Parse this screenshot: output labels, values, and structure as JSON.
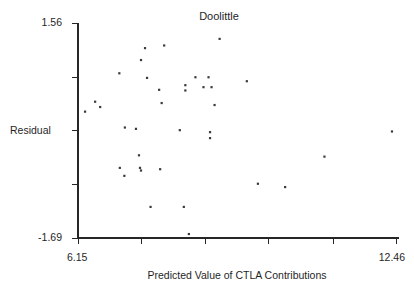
{
  "chart_data": {
    "type": "scatter",
    "title": "Doolittle",
    "xlabel": "Predicted Value of CTLA Contributions",
    "ylabel": "Residual",
    "xlim": [
      6.15,
      12.46
    ],
    "ylim": [
      -1.69,
      1.56
    ],
    "grid": false,
    "legend": null,
    "x_tick_labels": [
      "6.15",
      "12.46"
    ],
    "y_tick_labels": [
      "1.56",
      "-1.69"
    ],
    "x_tick_values": [
      6.15,
      7.41,
      8.67,
      9.93,
      11.2,
      12.46
    ],
    "y_tick_values": [
      1.56,
      0.75,
      -0.06,
      -0.88,
      -1.69
    ],
    "marker": "square",
    "marker_color": "#3a3a3a",
    "points": [
      {
        "x": 7.48,
        "y": 1.18
      },
      {
        "x": 7.86,
        "y": 1.22
      },
      {
        "x": 7.4,
        "y": 1.0
      },
      {
        "x": 8.96,
        "y": 1.32
      },
      {
        "x": 6.97,
        "y": 0.8
      },
      {
        "x": 7.52,
        "y": 0.73
      },
      {
        "x": 7.76,
        "y": 0.55
      },
      {
        "x": 8.48,
        "y": 0.74
      },
      {
        "x": 8.74,
        "y": 0.74
      },
      {
        "x": 8.28,
        "y": 0.62
      },
      {
        "x": 8.28,
        "y": 0.54
      },
      {
        "x": 8.64,
        "y": 0.59
      },
      {
        "x": 8.8,
        "y": 0.59
      },
      {
        "x": 9.5,
        "y": 0.68
      },
      {
        "x": 6.49,
        "y": 0.37
      },
      {
        "x": 6.59,
        "y": 0.29
      },
      {
        "x": 6.29,
        "y": 0.22
      },
      {
        "x": 7.81,
        "y": 0.35
      },
      {
        "x": 8.86,
        "y": 0.32
      },
      {
        "x": 7.08,
        "y": -0.02
      },
      {
        "x": 7.3,
        "y": -0.04
      },
      {
        "x": 8.17,
        "y": -0.06
      },
      {
        "x": 8.77,
        "y": -0.09
      },
      {
        "x": 8.77,
        "y": -0.18
      },
      {
        "x": 12.38,
        "y": -0.08
      },
      {
        "x": 7.36,
        "y": -0.44
      },
      {
        "x": 6.98,
        "y": -0.63
      },
      {
        "x": 7.38,
        "y": -0.63
      },
      {
        "x": 7.4,
        "y": -0.67
      },
      {
        "x": 7.78,
        "y": -0.65
      },
      {
        "x": 7.07,
        "y": -0.75
      },
      {
        "x": 11.04,
        "y": -0.46
      },
      {
        "x": 9.72,
        "y": -0.87
      },
      {
        "x": 10.26,
        "y": -0.92
      },
      {
        "x": 7.59,
        "y": -1.22
      },
      {
        "x": 8.25,
        "y": -1.22
      },
      {
        "x": 8.35,
        "y": -1.63
      }
    ]
  }
}
